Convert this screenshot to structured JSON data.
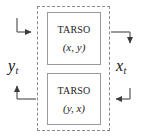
{
  "diagram": {
    "boundary": {
      "name": "system-boundary",
      "style": "dashed"
    },
    "blocks": [
      {
        "id": "tarso-forward",
        "title": "TARSO",
        "args": "(x, y)"
      },
      {
        "id": "tarso-inverse",
        "title": "TARSO",
        "args": "(y, x)"
      }
    ],
    "signals": [
      {
        "id": "output-y",
        "symbol": "y",
        "subscript": "t",
        "side": "left",
        "direction": "out"
      },
      {
        "id": "input-x",
        "symbol": "x",
        "subscript": "t",
        "side": "right",
        "direction": "in"
      }
    ],
    "connectors": [
      {
        "id": "input-top-left",
        "from": "left-bus",
        "to": "tarso-forward",
        "arrow": "right"
      },
      {
        "id": "output-top-right",
        "from": "tarso-forward",
        "to": "right-bus",
        "arrow": "down"
      },
      {
        "id": "input-bottom-right",
        "from": "right-bus",
        "to": "tarso-inverse",
        "arrow": "left"
      },
      {
        "id": "output-bottom-left",
        "from": "tarso-inverse",
        "to": "left-bus",
        "arrow": "up"
      }
    ],
    "colors": {
      "line": "#6f6f6f",
      "boundary": "#8a8a8a",
      "block_border": "#9a9a9a",
      "text": "#1a1a1a",
      "background": "#ffffff"
    }
  }
}
